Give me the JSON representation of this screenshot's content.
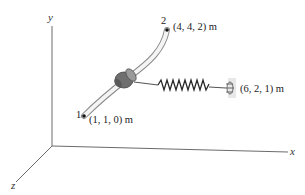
{
  "axes": {
    "x_label": "x",
    "y_label": "y",
    "z_label": "z"
  },
  "points": [
    {
      "id": "1",
      "number_label": "1",
      "coord_label": "(1, 1, 0) m"
    },
    {
      "id": "2",
      "number_label": "2",
      "coord_label": "(4, 4, 2) m"
    },
    {
      "id": "anchor",
      "coord_label": "(6, 2, 1) m"
    }
  ],
  "elements": {
    "rod": "curved-rod",
    "collar": "collar",
    "spring": "spring",
    "anchor": "wall-anchor"
  },
  "colors": {
    "axis": "#6b6b6b",
    "rod_fill": "#f2f2f2",
    "rod_edge": "#8a8a8a",
    "collar": "#7d7d7d",
    "spring": "#2a2a2a",
    "text": "#222222"
  }
}
